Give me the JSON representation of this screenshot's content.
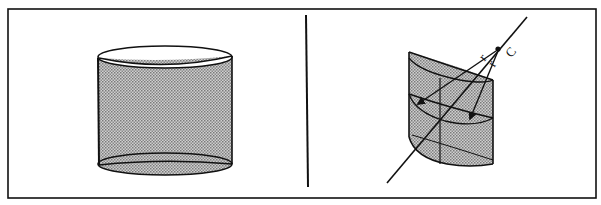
{
  "figure": {
    "panels": [
      {
        "id": "left",
        "description": "Right circular cylinder (shaded lateral surface)",
        "shape": "cylinder"
      },
      {
        "id": "right",
        "description": "Section of cylinder with axis line through point C and radius vectors r",
        "shape": "cylinder-section-with-axis",
        "labels": {
          "point": "C",
          "radius_1": "r",
          "radius_2": "r"
        }
      }
    ]
  },
  "colors": {
    "stroke": "#111111",
    "fill_shade": "#a9a9a9",
    "background": "#ffffff"
  }
}
